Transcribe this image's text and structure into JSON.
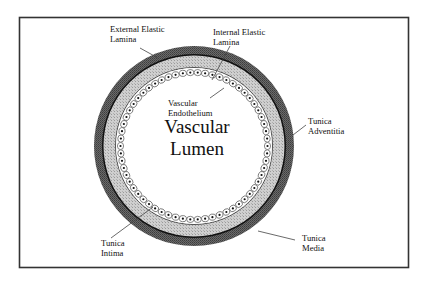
{
  "diagram": {
    "center_label": [
      "Vascular",
      "Lumen"
    ],
    "labels": {
      "external_elastic_lamina": [
        "External Elastic",
        "Lamina"
      ],
      "internal_elastic_lamina": [
        "Internal Elastic",
        "Lamina"
      ],
      "vascular_endothelium": [
        "Vascular",
        "Endothelium"
      ],
      "tunica_adventitia": [
        "Tunica",
        "Adventitia"
      ],
      "tunica_intima": [
        "Tunica",
        "Intima"
      ],
      "tunica_media": [
        "Tunica",
        "Media"
      ]
    },
    "layers": [
      {
        "name": "Tunica Adventitia",
        "color": "#5a5a5a"
      },
      {
        "name": "External Elastic Lamina",
        "color": "#111111"
      },
      {
        "name": "Tunica Media",
        "color": "#c4c4c4"
      },
      {
        "name": "Internal Elastic Lamina",
        "color": "#222222"
      },
      {
        "name": "Vascular Endothelium",
        "color": "#ffffff"
      },
      {
        "name": "Vascular Lumen",
        "color": "#ffffff"
      }
    ]
  }
}
